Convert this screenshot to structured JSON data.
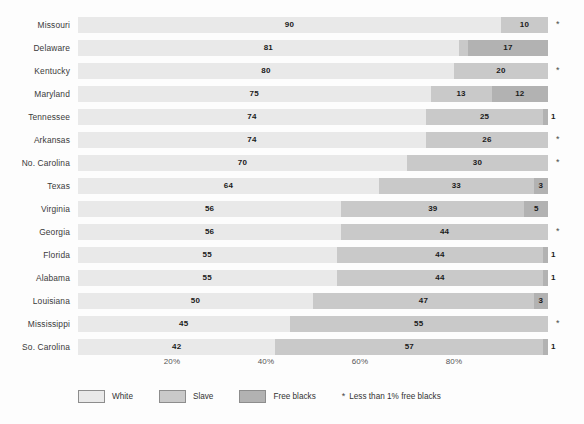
{
  "chart_data": {
    "type": "bar",
    "orientation": "horizontal",
    "stacked": true,
    "normalized_percent": true,
    "title": "",
    "subtitle": "",
    "xlabel": "",
    "ylabel": "",
    "xlim": [
      0,
      100
    ],
    "grid": false,
    "legend_position": "bottom",
    "tick_labels": [
      "20%",
      "40%",
      "60%",
      "80%"
    ],
    "tick_values": [
      20,
      40,
      60,
      80
    ],
    "categories": [
      "Missouri",
      "Delaware",
      "Kentucky",
      "Maryland",
      "Tennessee",
      "Arkansas",
      "No. Carolina",
      "Texas",
      "Virginia",
      "Georgia",
      "Florida",
      "Alabama",
      "Louisiana",
      "Mississippi",
      "So. Carolina"
    ],
    "series": [
      {
        "name": "White",
        "color": "#e9e9e9",
        "values": [
          90,
          81,
          80,
          75,
          74,
          74,
          70,
          64,
          56,
          56,
          55,
          55,
          50,
          45,
          42
        ]
      },
      {
        "name": "Slave",
        "color": "#c9c9c9",
        "values": [
          10,
          2,
          20,
          13,
          25,
          26,
          30,
          33,
          39,
          44,
          44,
          44,
          47,
          55,
          57
        ]
      },
      {
        "name": "Free blacks",
        "color": "#b2b2b2",
        "values": [
          0,
          17,
          0,
          12,
          1,
          0,
          0,
          3,
          5,
          0,
          1,
          1,
          3,
          0,
          1
        ]
      }
    ],
    "annotations": {
      "asterisk_symbol": "*",
      "asterisk_note": "Less than 1% free blacks",
      "asterisk_rows": [
        "Missouri",
        "Kentucky",
        "Arkansas",
        "No. Carolina",
        "Georgia",
        "Mississippi"
      ],
      "callout_rows": [
        {
          "category": "Delaware",
          "series": "Slave",
          "label": "2"
        }
      ]
    }
  },
  "rows": [
    {
      "state": "Missouri",
      "segments": [
        {
          "series": "White",
          "value": 90,
          "label": "90",
          "label_position": "inside"
        },
        {
          "series": "Slave",
          "value": 10,
          "label": "10",
          "label_position": "inside"
        }
      ],
      "star": "*"
    },
    {
      "state": "Delaware",
      "segments": [
        {
          "series": "White",
          "value": 81,
          "label": "81",
          "label_position": "inside"
        },
        {
          "series": "Slave",
          "value": 2,
          "label": "2",
          "label_position": "callout"
        },
        {
          "series": "Free blacks",
          "value": 17,
          "label": "17",
          "label_position": "inside"
        }
      ],
      "star": ""
    },
    {
      "state": "Kentucky",
      "segments": [
        {
          "series": "White",
          "value": 80,
          "label": "80",
          "label_position": "inside"
        },
        {
          "series": "Slave",
          "value": 20,
          "label": "20",
          "label_position": "inside"
        }
      ],
      "star": "*"
    },
    {
      "state": "Maryland",
      "segments": [
        {
          "series": "White",
          "value": 75,
          "label": "75",
          "label_position": "inside"
        },
        {
          "series": "Slave",
          "value": 13,
          "label": "13",
          "label_position": "inside"
        },
        {
          "series": "Free blacks",
          "value": 12,
          "label": "12",
          "label_position": "inside"
        }
      ],
      "star": ""
    },
    {
      "state": "Tennessee",
      "segments": [
        {
          "series": "White",
          "value": 74,
          "label": "74",
          "label_position": "inside"
        },
        {
          "series": "Slave",
          "value": 25,
          "label": "25",
          "label_position": "inside"
        },
        {
          "series": "Free blacks",
          "value": 1,
          "label": "1",
          "label_position": "outside"
        }
      ],
      "star": ""
    },
    {
      "state": "Arkansas",
      "segments": [
        {
          "series": "White",
          "value": 74,
          "label": "74",
          "label_position": "inside"
        },
        {
          "series": "Slave",
          "value": 26,
          "label": "26",
          "label_position": "inside"
        }
      ],
      "star": "*"
    },
    {
      "state": "No. Carolina",
      "segments": [
        {
          "series": "White",
          "value": 70,
          "label": "70",
          "label_position": "inside"
        },
        {
          "series": "Slave",
          "value": 30,
          "label": "30",
          "label_position": "inside"
        }
      ],
      "star": "*"
    },
    {
      "state": "Texas",
      "segments": [
        {
          "series": "White",
          "value": 64,
          "label": "64",
          "label_position": "inside"
        },
        {
          "series": "Slave",
          "value": 33,
          "label": "33",
          "label_position": "inside"
        },
        {
          "series": "Free blacks",
          "value": 3,
          "label": "3",
          "label_position": "inside"
        }
      ],
      "star": ""
    },
    {
      "state": "Virginia",
      "segments": [
        {
          "series": "White",
          "value": 56,
          "label": "56",
          "label_position": "inside"
        },
        {
          "series": "Slave",
          "value": 39,
          "label": "39",
          "label_position": "inside"
        },
        {
          "series": "Free blacks",
          "value": 5,
          "label": "5",
          "label_position": "inside"
        }
      ],
      "star": ""
    },
    {
      "state": "Georgia",
      "segments": [
        {
          "series": "White",
          "value": 56,
          "label": "56",
          "label_position": "inside"
        },
        {
          "series": "Slave",
          "value": 44,
          "label": "44",
          "label_position": "inside"
        }
      ],
      "star": "*"
    },
    {
      "state": "Florida",
      "segments": [
        {
          "series": "White",
          "value": 55,
          "label": "55",
          "label_position": "inside"
        },
        {
          "series": "Slave",
          "value": 44,
          "label": "44",
          "label_position": "inside"
        },
        {
          "series": "Free blacks",
          "value": 1,
          "label": "1",
          "label_position": "outside"
        }
      ],
      "star": ""
    },
    {
      "state": "Alabama",
      "segments": [
        {
          "series": "White",
          "value": 55,
          "label": "55",
          "label_position": "inside"
        },
        {
          "series": "Slave",
          "value": 44,
          "label": "44",
          "label_position": "inside"
        },
        {
          "series": "Free blacks",
          "value": 1,
          "label": "1",
          "label_position": "outside"
        }
      ],
      "star": ""
    },
    {
      "state": "Louisiana",
      "segments": [
        {
          "series": "White",
          "value": 50,
          "label": "50",
          "label_position": "inside"
        },
        {
          "series": "Slave",
          "value": 47,
          "label": "47",
          "label_position": "inside"
        },
        {
          "series": "Free blacks",
          "value": 3,
          "label": "3",
          "label_position": "inside"
        }
      ],
      "star": ""
    },
    {
      "state": "Mississippi",
      "segments": [
        {
          "series": "White",
          "value": 45,
          "label": "45",
          "label_position": "inside"
        },
        {
          "series": "Slave",
          "value": 55,
          "label": "55",
          "label_position": "inside"
        }
      ],
      "star": "*"
    },
    {
      "state": "So. Carolina",
      "segments": [
        {
          "series": "White",
          "value": 42,
          "label": "42",
          "label_position": "inside"
        },
        {
          "series": "Slave",
          "value": 57,
          "label": "57",
          "label_position": "inside"
        },
        {
          "series": "Free blacks",
          "value": 1,
          "label": "1",
          "label_position": "outside"
        }
      ],
      "star": ""
    }
  ],
  "axis": {
    "ticks": [
      {
        "label": "20%",
        "value": 20
      },
      {
        "label": "40%",
        "value": 40
      },
      {
        "label": "60%",
        "value": 60
      },
      {
        "label": "80%",
        "value": 80
      }
    ]
  },
  "legend": {
    "items": [
      {
        "label": "White",
        "color": "#e9e9e9"
      },
      {
        "label": "Slave",
        "color": "#c9c9c9"
      },
      {
        "label": "Free blacks",
        "color": "#b2b2b2"
      }
    ],
    "note_symbol": "*",
    "note_text": "Less than 1% free blacks"
  }
}
